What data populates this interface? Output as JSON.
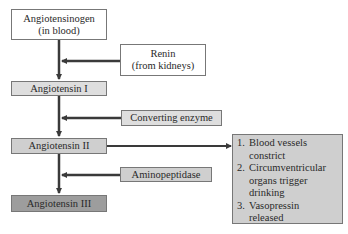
{
  "diagram": {
    "main_chain": [
      {
        "id": "angiotensinogen",
        "line1": "Angiotensinogen",
        "line2": "(in blood)",
        "fill": "#ffffff"
      },
      {
        "id": "angiotensin-1",
        "label": "Angiotensin I",
        "fill": "#dedede"
      },
      {
        "id": "angiotensin-2",
        "label": "Angiotensin II",
        "fill": "#cfcfcf"
      },
      {
        "id": "angiotensin-3",
        "label": "Angiotensin III",
        "fill": "#9d9d9d"
      }
    ],
    "enzymes": [
      {
        "id": "renin",
        "line1": "Renin",
        "line2": "(from kidneys)",
        "fill": "#ffffff"
      },
      {
        "id": "converting-enzyme",
        "label": "Converting enzyme",
        "fill": "#dedede"
      },
      {
        "id": "aminopeptidase",
        "label": "Aminopeptidase",
        "fill": "#cfcfcf"
      }
    ],
    "effects": {
      "fill": "#cfcfcf",
      "items": [
        {
          "num": "1.",
          "line1": "Blood vessels",
          "line2": "constrict"
        },
        {
          "num": "2.",
          "line1": "Circumventricular",
          "line2": "organs trigger",
          "line3": "drinking"
        },
        {
          "num": "3.",
          "line1": "Vasopressin",
          "line2": "released"
        }
      ]
    },
    "arrow_color": "#3a3a3a"
  }
}
